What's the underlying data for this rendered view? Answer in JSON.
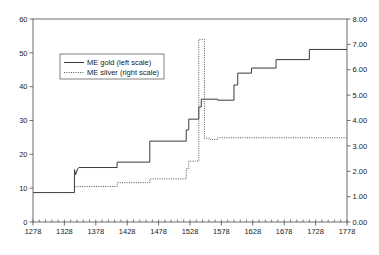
{
  "chart_data": {
    "type": "line",
    "title": "",
    "xlabel": "",
    "ylabel": "£stg./lb. troy",
    "ylabel_right": "£stg./lb. troy",
    "xlim": [
      1278,
      1778
    ],
    "ylim": [
      0,
      60
    ],
    "ylim_right": [
      0.0,
      8.0
    ],
    "xticks": [
      1278,
      1328,
      1378,
      1428,
      1478,
      1528,
      1578,
      1628,
      1678,
      1728,
      1778
    ],
    "xticklabels": [
      "1278",
      "1328",
      "1378",
      "1428",
      "1478",
      "1528",
      "1578",
      "1628",
      "1678",
      "1728",
      "1778"
    ],
    "yticks": [
      0,
      10,
      20,
      30,
      40,
      50,
      60
    ],
    "yticklabels": [
      "0",
      "10",
      "20",
      "30",
      "40",
      "50",
      "60"
    ],
    "yticks_right": [
      0.0,
      1.0,
      2.0,
      3.0,
      4.0,
      5.0,
      6.0,
      7.0,
      8.0
    ],
    "yticklabels_right": [
      "0.00",
      "1.00",
      "2.00",
      "3.00",
      "4.00",
      "5.00",
      "6.00",
      "7.00",
      "8.00"
    ],
    "minor_xticks_interval": 10,
    "grid": false,
    "legend_position": "upper-left-inset",
    "series": [
      {
        "name": "ME gold (left scale)",
        "axis": "left",
        "style": "solid",
        "color": "#3a3a3a",
        "step": true,
        "points": [
          {
            "x": 1278,
            "y": 8.7
          },
          {
            "x": 1344,
            "y": 8.7
          },
          {
            "x": 1344,
            "y": 15.5
          },
          {
            "x": 1346,
            "y": 14.0
          },
          {
            "x": 1349,
            "y": 15.7
          },
          {
            "x": 1351,
            "y": 16.1
          },
          {
            "x": 1412,
            "y": 16.1
          },
          {
            "x": 1412,
            "y": 17.7
          },
          {
            "x": 1464,
            "y": 17.7
          },
          {
            "x": 1464,
            "y": 23.9
          },
          {
            "x": 1522,
            "y": 23.9
          },
          {
            "x": 1522,
            "y": 27.2
          },
          {
            "x": 1526,
            "y": 27.2
          },
          {
            "x": 1526,
            "y": 30.4
          },
          {
            "x": 1542,
            "y": 30.4
          },
          {
            "x": 1542,
            "y": 34.0
          },
          {
            "x": 1546,
            "y": 34.0
          },
          {
            "x": 1546,
            "y": 36.3
          },
          {
            "x": 1572,
            "y": 36.3
          },
          {
            "x": 1572,
            "y": 36.0
          },
          {
            "x": 1598,
            "y": 36.0
          },
          {
            "x": 1598,
            "y": 40.5
          },
          {
            "x": 1604,
            "y": 40.5
          },
          {
            "x": 1604,
            "y": 44.0
          },
          {
            "x": 1626,
            "y": 44.0
          },
          {
            "x": 1626,
            "y": 45.5
          },
          {
            "x": 1665,
            "y": 45.5
          },
          {
            "x": 1665,
            "y": 48.0
          },
          {
            "x": 1718,
            "y": 48.0
          },
          {
            "x": 1718,
            "y": 51.0
          },
          {
            "x": 1778,
            "y": 51.0
          }
        ]
      },
      {
        "name": "ME silver (right scale)",
        "axis": "right",
        "style": "dotted",
        "color": "#555555",
        "step": true,
        "points": [
          {
            "x": 1278,
            "y": 1.16
          },
          {
            "x": 1344,
            "y": 1.16
          },
          {
            "x": 1344,
            "y": 1.39
          },
          {
            "x": 1351,
            "y": 1.39
          },
          {
            "x": 1351,
            "y": 1.4
          },
          {
            "x": 1412,
            "y": 1.4
          },
          {
            "x": 1412,
            "y": 1.55
          },
          {
            "x": 1464,
            "y": 1.55
          },
          {
            "x": 1464,
            "y": 1.7
          },
          {
            "x": 1522,
            "y": 1.7
          },
          {
            "x": 1522,
            "y": 2.1
          },
          {
            "x": 1526,
            "y": 2.1
          },
          {
            "x": 1526,
            "y": 2.4
          },
          {
            "x": 1542,
            "y": 2.4
          },
          {
            "x": 1542,
            "y": 7.2
          },
          {
            "x": 1551,
            "y": 7.2
          },
          {
            "x": 1551,
            "y": 3.3
          },
          {
            "x": 1560,
            "y": 3.3
          },
          {
            "x": 1560,
            "y": 3.25
          },
          {
            "x": 1572,
            "y": 3.25
          },
          {
            "x": 1572,
            "y": 3.32
          },
          {
            "x": 1778,
            "y": 3.32
          }
        ]
      }
    ],
    "legend": [
      {
        "label": "ME gold (left scale)",
        "style": "solid"
      },
      {
        "label": "ME silver (right scale)",
        "style": "dotted"
      }
    ]
  }
}
